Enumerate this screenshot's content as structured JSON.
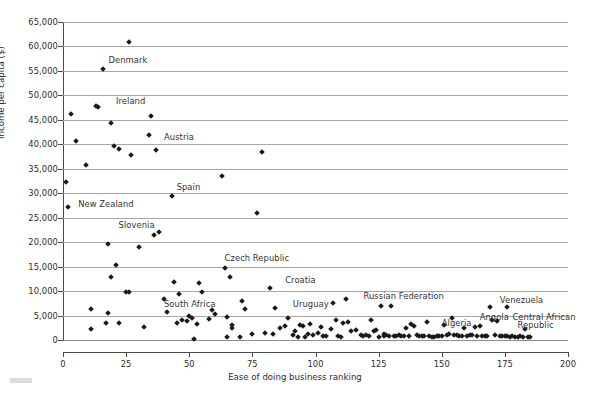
{
  "chart_data": {
    "type": "scatter",
    "title": "",
    "xlabel": "Ease of doing business ranking",
    "ylabel": "Income per capita ($)",
    "xlim": [
      0,
      200
    ],
    "ylim": [
      0,
      65000
    ],
    "xticks": [
      0,
      25,
      50,
      75,
      100,
      125,
      150,
      175,
      200
    ],
    "xticklabels": [
      "0",
      "25",
      "50",
      "75",
      "100",
      "125",
      "150",
      "175",
      "200"
    ],
    "yticks": [
      0,
      5000,
      10000,
      15000,
      20000,
      25000,
      30000,
      35000,
      40000,
      45000,
      50000,
      55000,
      60000,
      65000
    ],
    "yticklabels": [
      "0",
      "5,000",
      "10,000",
      "15,000",
      "20,000",
      "25,000",
      "30,000",
      "35,000",
      "40,000",
      "45,000",
      "50,000",
      "55,000",
      "60,000",
      "65,000"
    ],
    "grid": "horizontal",
    "legend": "none",
    "marker": "diamond",
    "marker_color": "#1a1a1a",
    "gridline_color": "#a8a8a8",
    "axis_color": "#4a4a4a",
    "points": [
      [
        1,
        32300
      ],
      [
        2,
        27100
      ],
      [
        3,
        46100
      ],
      [
        5,
        40600
      ],
      [
        9,
        35700
      ],
      [
        11,
        6400
      ],
      [
        11,
        2200
      ],
      [
        13,
        47800
      ],
      [
        14,
        47600
      ],
      [
        16,
        55400
      ],
      [
        17,
        3400
      ],
      [
        18,
        19700
      ],
      [
        18,
        5500
      ],
      [
        19,
        44400
      ],
      [
        19,
        12900
      ],
      [
        20,
        39600
      ],
      [
        21,
        15400
      ],
      [
        22,
        39000
      ],
      [
        22,
        3400
      ],
      [
        25,
        9900
      ],
      [
        26,
        60900
      ],
      [
        26,
        9800
      ],
      [
        27,
        37800
      ],
      [
        30,
        19000
      ],
      [
        32,
        2600
      ],
      [
        34,
        41900
      ],
      [
        35,
        45700
      ],
      [
        36,
        21500
      ],
      [
        37,
        38800
      ],
      [
        38,
        22100
      ],
      [
        40,
        8300
      ],
      [
        41,
        5700
      ],
      [
        43,
        29400
      ],
      [
        44,
        11800
      ],
      [
        45,
        3500
      ],
      [
        46,
        9500
      ],
      [
        47,
        4000
      ],
      [
        49,
        3900
      ],
      [
        50,
        5000
      ],
      [
        51,
        4500
      ],
      [
        52,
        300
      ],
      [
        53,
        3200
      ],
      [
        54,
        11700
      ],
      [
        55,
        9900
      ],
      [
        58,
        4300
      ],
      [
        59,
        6100
      ],
      [
        60,
        5400
      ],
      [
        63,
        33600
      ],
      [
        64,
        14700
      ],
      [
        65,
        4600
      ],
      [
        65,
        600
      ],
      [
        66,
        12900
      ],
      [
        67,
        3100
      ],
      [
        67,
        2500
      ],
      [
        70,
        600
      ],
      [
        71,
        8000
      ],
      [
        72,
        6400
      ],
      [
        75,
        1300
      ],
      [
        77,
        25900
      ],
      [
        79,
        38400
      ],
      [
        80,
        1400
      ],
      [
        82,
        10600
      ],
      [
        83,
        1300
      ],
      [
        84,
        6500
      ],
      [
        86,
        2400
      ],
      [
        88,
        2900
      ],
      [
        89,
        4400
      ],
      [
        91,
        1000
      ],
      [
        92,
        1800
      ],
      [
        93,
        700
      ],
      [
        94,
        3000
      ],
      [
        95,
        2900
      ],
      [
        96,
        700
      ],
      [
        97,
        1200
      ],
      [
        98,
        3200
      ],
      [
        99,
        1000
      ],
      [
        101,
        1400
      ],
      [
        102,
        2600
      ],
      [
        103,
        800
      ],
      [
        104,
        900
      ],
      [
        106,
        2200
      ],
      [
        107,
        7500
      ],
      [
        108,
        4100
      ],
      [
        109,
        800
      ],
      [
        110,
        700
      ],
      [
        111,
        3400
      ],
      [
        112,
        8300
      ],
      [
        113,
        3600
      ],
      [
        114,
        1800
      ],
      [
        116,
        2100
      ],
      [
        118,
        1000
      ],
      [
        119,
        900
      ],
      [
        120,
        1000
      ],
      [
        121,
        900
      ],
      [
        122,
        4000
      ],
      [
        123,
        1800
      ],
      [
        124,
        2100
      ],
      [
        125,
        700
      ],
      [
        126,
        7000
      ],
      [
        127,
        900
      ],
      [
        127,
        1300
      ],
      [
        128,
        1000
      ],
      [
        129,
        900
      ],
      [
        130,
        6900
      ],
      [
        131,
        800
      ],
      [
        132,
        900
      ],
      [
        133,
        1100
      ],
      [
        134,
        900
      ],
      [
        135,
        800
      ],
      [
        136,
        2500
      ],
      [
        137,
        900
      ],
      [
        138,
        3200
      ],
      [
        139,
        2800
      ],
      [
        140,
        1000
      ],
      [
        141,
        900
      ],
      [
        142,
        800
      ],
      [
        143,
        800
      ],
      [
        144,
        3700
      ],
      [
        145,
        900
      ],
      [
        146,
        700
      ],
      [
        147,
        700
      ],
      [
        148,
        900
      ],
      [
        149,
        800
      ],
      [
        150,
        800
      ],
      [
        151,
        3100
      ],
      [
        152,
        1000
      ],
      [
        153,
        1200
      ],
      [
        154,
        4400
      ],
      [
        155,
        1000
      ],
      [
        156,
        1000
      ],
      [
        157,
        900
      ],
      [
        158,
        800
      ],
      [
        159,
        2400
      ],
      [
        160,
        900
      ],
      [
        161,
        1100
      ],
      [
        162,
        1000
      ],
      [
        163,
        2700
      ],
      [
        164,
        800
      ],
      [
        165,
        2800
      ],
      [
        166,
        800
      ],
      [
        167,
        900
      ],
      [
        168,
        900
      ],
      [
        169,
        6800
      ],
      [
        170,
        4000
      ],
      [
        171,
        1000
      ],
      [
        172,
        3900
      ],
      [
        173,
        900
      ],
      [
        174,
        800
      ],
      [
        175,
        900
      ],
      [
        176,
        6700
      ],
      [
        176,
        800
      ],
      [
        177,
        700
      ],
      [
        178,
        800
      ],
      [
        179,
        700
      ],
      [
        180,
        700
      ],
      [
        181,
        900
      ],
      [
        182,
        600
      ],
      [
        183,
        2300
      ],
      [
        184,
        600
      ],
      [
        185,
        600
      ]
    ],
    "annotations": [
      {
        "text": "Denmark",
        "x": 18,
        "y": 57200,
        "anchor": "left"
      },
      {
        "text": "Ireland",
        "x": 21,
        "y": 48800,
        "anchor": "left"
      },
      {
        "text": "Austria",
        "x": 40,
        "y": 41400,
        "anchor": "left"
      },
      {
        "text": "Spain",
        "x": 45,
        "y": 31200,
        "anchor": "left"
      },
      {
        "text": "New Zealand",
        "x": 6,
        "y": 27800,
        "anchor": "left"
      },
      {
        "text": "Slovenia",
        "x": 22,
        "y": 23500,
        "anchor": "left"
      },
      {
        "text": "Czech Republic",
        "x": 64,
        "y": 16800,
        "anchor": "left"
      },
      {
        "text": "Croatia",
        "x": 88,
        "y": 12300,
        "anchor": "left"
      },
      {
        "text": "South Africa",
        "x": 40,
        "y": 7400,
        "anchor": "left"
      },
      {
        "text": "Uruguay",
        "x": 91,
        "y": 7400,
        "anchor": "left"
      },
      {
        "text": "Russian Federation",
        "x": 119,
        "y": 9000,
        "anchor": "left"
      },
      {
        "text": "Venezuela",
        "x": 173,
        "y": 8100,
        "anchor": "left"
      },
      {
        "text": "Algeria",
        "x": 150,
        "y": 3500,
        "anchor": "left"
      },
      {
        "text": "Angola",
        "x": 165,
        "y": 4700,
        "anchor": "left"
      },
      {
        "text": "Central African",
        "x": 178,
        "y": 4700,
        "anchor": "left"
      },
      {
        "text": "Republic",
        "x": 180,
        "y": 3000,
        "anchor": "left"
      }
    ]
  }
}
